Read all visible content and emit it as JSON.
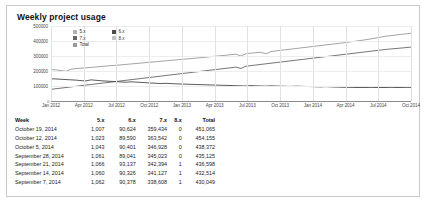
{
  "panel": {
    "title": "Weekly project usage"
  },
  "legend": {
    "items": [
      {
        "label": "5.x",
        "color": "#b0b0b0"
      },
      {
        "label": "6.x",
        "color": "#4a4a4a"
      },
      {
        "label": "7.x",
        "color": "#666666"
      },
      {
        "label": "8.x",
        "color": "#c4c4c4"
      },
      {
        "label": "Total",
        "color": "#9a9a9a"
      }
    ]
  },
  "table": {
    "columns": [
      "Week",
      "5.x",
      "6.x",
      "7.x",
      "8.x",
      "Total"
    ],
    "rows": [
      {
        "week": "October 19, 2014",
        "v5": "1,007",
        "v6": "90,624",
        "v7": "359,434",
        "v8": "0",
        "total": "451,065"
      },
      {
        "week": "October 12, 2014",
        "v5": "1,023",
        "v6": "89,590",
        "v7": "363,542",
        "v8": "0",
        "total": "454,155"
      },
      {
        "week": "October 5, 2014",
        "v5": "1,043",
        "v6": "90,401",
        "v7": "346,928",
        "v8": "0",
        "total": "438,372"
      },
      {
        "week": "September 28, 2014",
        "v5": "1,061",
        "v6": "89,041",
        "v7": "345,023",
        "v8": "0",
        "total": "435,125"
      },
      {
        "week": "September 21, 2014",
        "v5": "1,066",
        "v6": "93,137",
        "v7": "342,394",
        "v8": "1",
        "total": "436,598"
      },
      {
        "week": "September 14, 2014",
        "v5": "1,060",
        "v6": "90,326",
        "v7": "341,127",
        "v8": "1",
        "total": "432,514"
      },
      {
        "week": "September 7, 2014",
        "v5": "1,062",
        "v6": "90,378",
        "v7": "338,608",
        "v8": "1",
        "total": "430,049"
      }
    ]
  },
  "chart_data": {
    "type": "line",
    "title": "Weekly project usage",
    "xlabel": "",
    "ylabel": "",
    "grid": true,
    "legend_position": "top-left",
    "ylim": [
      0,
      500000
    ],
    "yticks": [
      500000,
      400000,
      300000,
      200000,
      100000
    ],
    "ytick_labels": [
      "500000",
      "400000",
      "300000",
      "200000",
      "100000"
    ],
    "zero_label": "0",
    "xticks": [
      "Jan 2012",
      "Apr 2012",
      "Jul 2012",
      "Oct 2012",
      "Jan 2013",
      "Apr 2013",
      "Jul 2013",
      "Oct 2013",
      "Jan 2014",
      "Apr 2014",
      "Jul 2014",
      "Oct 2014"
    ],
    "x_range": [
      "Jan 2012",
      "Oct 2014"
    ],
    "series": [
      {
        "name": "Total",
        "color": "#9a9a9a",
        "values": [
          210000,
          207000,
          203000,
          198000,
          212000,
          216000,
          219000,
          221000,
          224000,
          227000,
          230000,
          233000,
          236000,
          238000,
          241000,
          244000,
          247000,
          250000,
          253000,
          256000,
          259000,
          262000,
          265000,
          268000,
          271000,
          274000,
          277000,
          280000,
          283000,
          286000,
          289000,
          292000,
          296000,
          299000,
          302000,
          305000,
          309000,
          312000,
          300000,
          315000,
          319000,
          322000,
          325000,
          314000,
          330000,
          334000,
          338000,
          342000,
          346000,
          350000,
          354000,
          358000,
          362000,
          366000,
          370000,
          374000,
          378000,
          382000,
          386000,
          390000,
          395000,
          399000,
          404000,
          409000,
          414000,
          420000,
          426000,
          432000,
          436000,
          440000,
          444000,
          448000,
          451065
        ]
      },
      {
        "name": "7.x",
        "color": "#666666",
        "values": [
          78000,
          82000,
          86000,
          90000,
          94000,
          98000,
          102000,
          106000,
          110000,
          114000,
          118000,
          122000,
          126000,
          130000,
          134000,
          138000,
          142000,
          146000,
          150000,
          154000,
          158000,
          162000,
          166000,
          170000,
          174000,
          178000,
          182000,
          186000,
          190000,
          194000,
          198000,
          202000,
          206000,
          210000,
          214000,
          218000,
          222000,
          226000,
          217000,
          232000,
          236000,
          240000,
          244000,
          248000,
          252000,
          256000,
          260000,
          264000,
          268000,
          272000,
          276000,
          280000,
          284000,
          288000,
          292000,
          296000,
          300000,
          304000,
          308000,
          312000,
          316000,
          320000,
          324000,
          328000,
          332000,
          336000,
          340000,
          344000,
          347000,
          350000,
          353000,
          356000,
          359434
        ]
      },
      {
        "name": "6.x",
        "color": "#4a4a4a",
        "values": [
          148000,
          147000,
          145000,
          143000,
          141000,
          139000,
          136000,
          134000,
          141000,
          138000,
          135000,
          133000,
          131000,
          129000,
          127000,
          125000,
          128000,
          126000,
          124000,
          122000,
          120000,
          118000,
          116000,
          118000,
          116000,
          114000,
          113000,
          112000,
          111000,
          110000,
          109000,
          108000,
          107000,
          106000,
          105000,
          104000,
          103000,
          102000,
          101000,
          100000,
          103000,
          101000,
          100000,
          99000,
          101000,
          100000,
          99000,
          98000,
          97000,
          99000,
          98000,
          97000,
          96000,
          95000,
          94000,
          96000,
          94000,
          93000,
          92000,
          91000,
          91000,
          90000,
          90000,
          90000,
          91000,
          90000,
          90000,
          90000,
          91000,
          90000,
          90000,
          91000,
          90624
        ]
      }
    ]
  }
}
